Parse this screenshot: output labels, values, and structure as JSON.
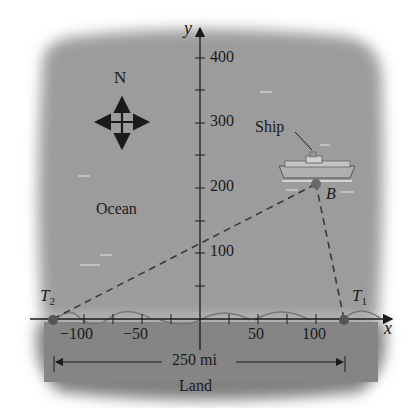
{
  "diagram": {
    "axes": {
      "x_label": "x",
      "y_label": "y"
    },
    "x_ticks": [
      {
        "value": -100,
        "label": "−100"
      },
      {
        "value": -50,
        "label": "−50"
      },
      {
        "value": 50,
        "label": "50"
      },
      {
        "value": 100,
        "label": "100"
      }
    ],
    "y_ticks": [
      {
        "value": 100,
        "label": "100"
      },
      {
        "value": 200,
        "label": "200"
      },
      {
        "value": 300,
        "label": "300"
      },
      {
        "value": 400,
        "label": "400"
      }
    ],
    "compass_label": "N",
    "ocean_label": "Ocean",
    "land_label": "Land",
    "ship_label": "Ship",
    "points": {
      "T1": {
        "label": "T",
        "sub": "1",
        "x": 125,
        "y": 0
      },
      "T2": {
        "label": "T",
        "sub": "2",
        "x": -125,
        "y": 0
      },
      "B": {
        "label": "B",
        "x": 100,
        "y": 205
      }
    },
    "distance_label": "250 mi",
    "colors": {
      "ocean": "#9a9a9a",
      "land": "#7e7e7e",
      "ink": "#1a1a1a",
      "point": "#5a5a5a"
    }
  }
}
